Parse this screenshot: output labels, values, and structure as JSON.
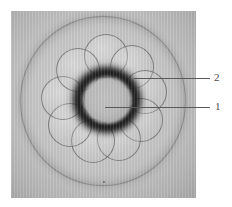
{
  "figure": {
    "kind": "light-micrograph",
    "caption_labels": [
      {
        "id": "1",
        "text": "1",
        "refers_to": "inner-dark-ring-lumen"
      },
      {
        "id": "2",
        "text": "2",
        "refers_to": "outer-blastomere-cell"
      }
    ],
    "colors": {
      "page_background": "#ffffff",
      "plate_background": "#c6c6c6",
      "dark_ring": "#1a1a1a",
      "leader_line": "#5a5a5a",
      "numeral": "#4c4c4c"
    },
    "elements": {
      "dish_ring_name": "large-out-of-focus-field-circle",
      "rosette_name": "blastomere-rosette",
      "dark_ring_name": "dark-annular-ring",
      "lumen_name": "inner-lumen",
      "speck_name": "debris-speck"
    },
    "blastomeres": [
      {
        "cx": 58,
        "cy": 14,
        "r": 21
      },
      {
        "cx": 84,
        "cy": 25,
        "r": 21
      },
      {
        "cx": 97,
        "cy": 50,
        "r": 21
      },
      {
        "cx": 93,
        "cy": 78,
        "r": 21
      },
      {
        "cx": 71,
        "cy": 97,
        "r": 21
      },
      {
        "cx": 45,
        "cy": 99,
        "r": 21
      },
      {
        "cx": 22,
        "cy": 83,
        "r": 21
      },
      {
        "cx": 15,
        "cy": 56,
        "r": 21
      },
      {
        "cx": 30,
        "cy": 28,
        "r": 21
      }
    ]
  }
}
